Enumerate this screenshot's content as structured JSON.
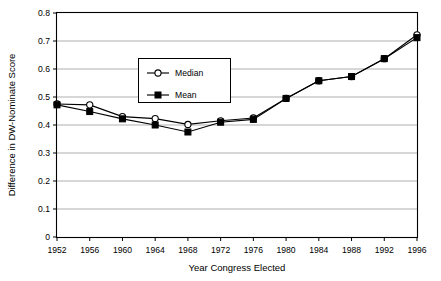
{
  "chart_data": {
    "type": "line",
    "title": "",
    "xlabel": "Year Congress Elected",
    "ylabel": "Difference in DW-Nominate Score",
    "categories": [
      "1952",
      "1956",
      "1960",
      "1964",
      "1968",
      "1972",
      "1976",
      "1980",
      "1984",
      "1988",
      "1992",
      "1996"
    ],
    "x": [
      1952,
      1956,
      1960,
      1964,
      1968,
      1972,
      1976,
      1980,
      1984,
      1988,
      1992,
      1996
    ],
    "xlim": [
      1952,
      1996
    ],
    "ylim": [
      0,
      0.8
    ],
    "yticks": [
      "0",
      "0.1",
      "0.2",
      "0.3",
      "0.4",
      "0.5",
      "0.6",
      "0.7",
      "0.8"
    ],
    "ytick_values": [
      0,
      0.1,
      0.2,
      0.3,
      0.4,
      0.5,
      0.6,
      0.7,
      0.8
    ],
    "grid": "horizontal",
    "legend_position": "upper-center-left",
    "series": [
      {
        "name": "Median",
        "marker": "open-circle",
        "values": [
          0.475,
          0.472,
          0.43,
          0.423,
          0.402,
          0.415,
          0.425,
          0.495,
          0.558,
          0.573,
          0.637,
          0.722
        ]
      },
      {
        "name": "Mean",
        "marker": "filled-square",
        "values": [
          0.472,
          0.448,
          0.422,
          0.4,
          0.375,
          0.41,
          0.42,
          0.495,
          0.558,
          0.573,
          0.637,
          0.712
        ]
      }
    ]
  },
  "legend": {
    "items": [
      {
        "label": "Median"
      },
      {
        "label": "Mean"
      }
    ]
  },
  "colors": {
    "line": "#000000",
    "grid": "#8c8c8c",
    "frame": "#000000",
    "background": "#ffffff"
  }
}
